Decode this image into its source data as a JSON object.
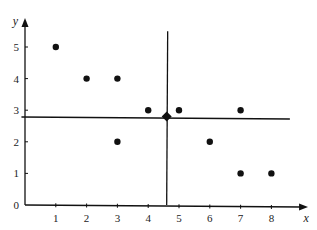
{
  "chart_data": {
    "type": "scatter",
    "title": "",
    "xlabel": "x",
    "ylabel": "y",
    "xlim": [
      0,
      8.8
    ],
    "ylim": [
      0,
      5.6
    ],
    "x_ticks": [
      1,
      2,
      3,
      4,
      5,
      6,
      7,
      8
    ],
    "y_ticks": [
      0,
      1,
      2,
      3,
      4,
      5
    ],
    "grid": false,
    "legend": null,
    "series": [
      {
        "name": "data points",
        "marker": "circle",
        "points": [
          {
            "x": 1,
            "y": 5
          },
          {
            "x": 2,
            "y": 4
          },
          {
            "x": 3,
            "y": 4
          },
          {
            "x": 4,
            "y": 3
          },
          {
            "x": 5,
            "y": 3
          },
          {
            "x": 3,
            "y": 2
          },
          {
            "x": 6,
            "y": 2
          },
          {
            "x": 7,
            "y": 3
          },
          {
            "x": 7,
            "y": 1
          },
          {
            "x": 8,
            "y": 1
          }
        ]
      },
      {
        "name": "mean point",
        "marker": "diamond",
        "points": [
          {
            "x": 4.6,
            "y": 2.8
          }
        ]
      }
    ],
    "reference_lines": [
      {
        "orientation": "horizontal",
        "y": 2.8,
        "x_from": -0.7,
        "x_to": 8.6
      },
      {
        "orientation": "vertical",
        "x": 4.6,
        "y_from": 0,
        "y_to": 5.5
      }
    ],
    "colors": {
      "ink": "#111111",
      "background": "#ffffff"
    }
  }
}
